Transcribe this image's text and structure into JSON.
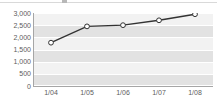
{
  "chart_data": {
    "type": "line",
    "title": "",
    "xlabel": "",
    "ylabel": "",
    "categories": [
      "1/04",
      "1/05",
      "1/06",
      "1/07",
      "1/08"
    ],
    "values": [
      1780,
      2450,
      2500,
      2700,
      2950
    ],
    "series": [
      {
        "name": "series-1",
        "values": [
          1780,
          2450,
          2500,
          2700,
          2950
        ]
      }
    ],
    "ylim": [
      0,
      3000
    ],
    "yticks": [
      0,
      500,
      1000,
      1500,
      2000,
      2500,
      3000
    ],
    "ytick_labels": [
      "0",
      "500",
      "1,000",
      "1,500",
      "2,000",
      "2,500",
      "3,000"
    ],
    "grid": true,
    "grid_style": "horizontal-banded",
    "legend": false,
    "legend_position": "none",
    "marker": "open-circle",
    "colors": {
      "line": "#333333",
      "marker_fill": "#ffffff",
      "marker_stroke": "#333333",
      "plot_band_dark": "#e2e2e2",
      "plot_band_light": "#f2f2f2",
      "gridline": "#ffffff",
      "axis": "#a6a6a6",
      "tick_text": "#5c5c5c",
      "background": "#ffffff"
    }
  }
}
